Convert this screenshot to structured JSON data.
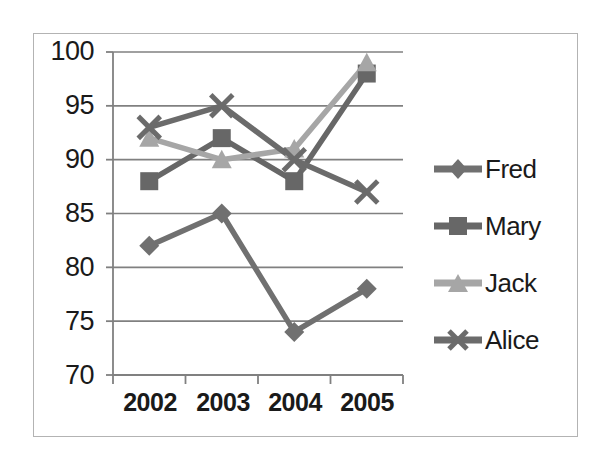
{
  "chart_data": {
    "type": "line",
    "title": "",
    "xlabel": "",
    "ylabel": "",
    "categories": [
      "2002",
      "2003",
      "2004",
      "2005"
    ],
    "ylim": [
      70,
      100
    ],
    "yticks": [
      70,
      75,
      80,
      85,
      90,
      95,
      100
    ],
    "ytick_labels": [
      "70",
      "75",
      "80",
      "85",
      "90",
      "95",
      "100"
    ],
    "grid": true,
    "grid_axis": "y",
    "legend_position": "right",
    "series": [
      {
        "name": "Fred",
        "marker": "diamond",
        "color": "#707070",
        "values": [
          82,
          85,
          74,
          78
        ]
      },
      {
        "name": "Mary",
        "marker": "square",
        "color": "#676767",
        "values": [
          88,
          92,
          88,
          98
        ]
      },
      {
        "name": "Jack",
        "marker": "triangle",
        "color": "#a6a6a6",
        "values": [
          92,
          90,
          91,
          99
        ]
      },
      {
        "name": "Alice",
        "marker": "cross",
        "color": "#6b6b6b",
        "values": [
          93,
          95,
          90,
          87
        ]
      }
    ]
  },
  "frame": {
    "border_color": "#b3b3b3",
    "background": "#ffffff"
  },
  "axes": {
    "axis_line_color": "#808080",
    "gridline_color": "#808080"
  }
}
